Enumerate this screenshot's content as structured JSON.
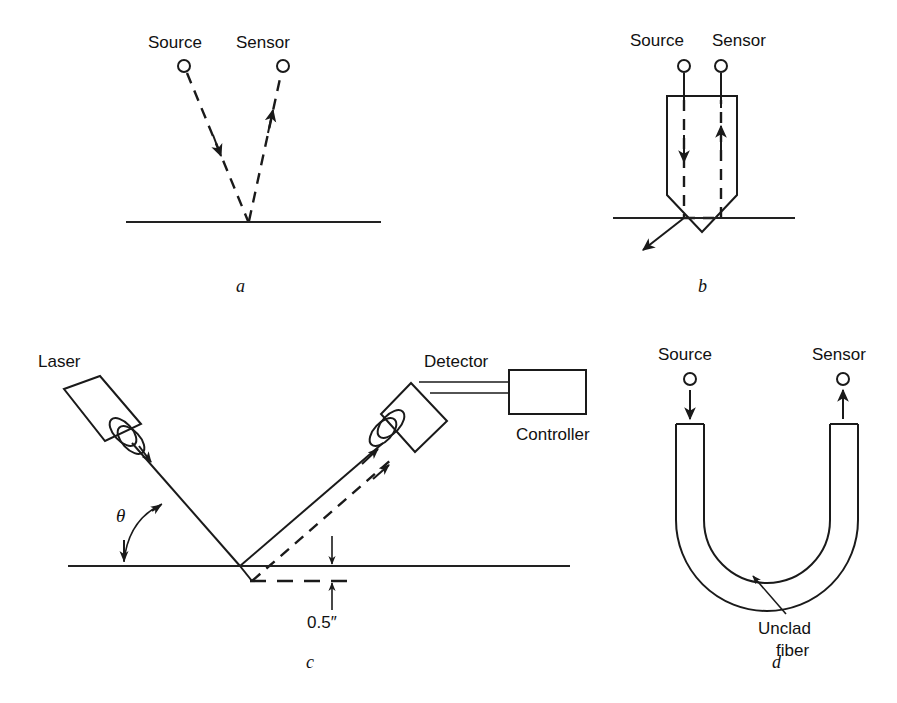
{
  "figure": {
    "background_color": "#ffffff",
    "line_color": "#1a1a1a",
    "panels": [
      {
        "id": "a",
        "letter": "a",
        "description": "Separate source and sensor aimed at a common point on a surface",
        "labels": {
          "source": "Source",
          "sensor": "Sensor"
        },
        "beam_style": "dashed",
        "surface": "solid-line"
      },
      {
        "id": "b",
        "letter": "b",
        "description": "Probe housing with source and sensor channels and a pointed tip on the surface",
        "labels": {
          "source": "Source",
          "sensor": "Sensor"
        },
        "beam_style": "dashed",
        "surface": "solid-line"
      },
      {
        "id": "c",
        "letter": "c",
        "description": "Laser triangulation gauge with detector, controller and 0.5 inch standoff range",
        "labels": {
          "laser": "Laser",
          "detector": "Detector",
          "controller": "Controller",
          "angle": "θ",
          "dimension": "0.5″"
        },
        "beam_style": "solid-and-dashed",
        "surface": "solid-line-plus-dashed-offset"
      },
      {
        "id": "d",
        "letter": "d",
        "description": "U-bend unclad optical fiber loop between source and sensor",
        "labels": {
          "source": "Source",
          "sensor": "Sensor",
          "annotation_line1": "Unclad",
          "annotation_line2": "fiber"
        },
        "beam_style": "solid-arrows",
        "surface": "none"
      }
    ]
  }
}
